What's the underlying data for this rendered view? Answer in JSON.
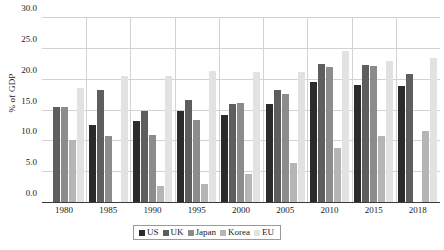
{
  "chart_data": {
    "type": "bar",
    "title": "",
    "xlabel": "",
    "ylabel": "% of GDP",
    "ylim": [
      0,
      30
    ],
    "ytick_step": 5,
    "yticks": [
      "0.0",
      "5.0",
      "10.0",
      "15.0",
      "20.0",
      "25.0",
      "30.0"
    ],
    "grid": true,
    "legend_position": "bottom",
    "categories": [
      "1980",
      "1985",
      "1990",
      "1995",
      "2000",
      "2005",
      "2010",
      "2015",
      "2018"
    ],
    "series": [
      {
        "name": "US",
        "color": "#2b2b2b",
        "values": [
          null,
          12.7,
          13.3,
          14.9,
          14.3,
          16.1,
          19.6,
          19.1,
          18.9
        ]
      },
      {
        "name": "UK",
        "color": "#5e5e5e",
        "values": [
          15.5,
          18.3,
          15.0,
          16.7,
          16.0,
          18.4,
          22.6,
          22.3,
          20.9
        ]
      },
      {
        "name": "Japan",
        "color": "#8c8c8c",
        "values": [
          15.6,
          10.9,
          11.1,
          13.4,
          16.2,
          17.6,
          22.1,
          22.2,
          null
        ]
      },
      {
        "name": "Korea",
        "color": "#b5b5b5",
        "values": [
          10.2,
          null,
          2.8,
          3.1,
          4.7,
          6.5,
          9.0,
          10.8,
          11.6
        ]
      },
      {
        "name": "EU",
        "color": "#e2e2e2",
        "values": [
          18.6,
          20.6,
          20.6,
          21.4,
          21.3,
          21.2,
          24.6,
          23.1,
          23.5
        ]
      }
    ]
  },
  "legend": {
    "items": [
      {
        "label": "US"
      },
      {
        "label": "UK"
      },
      {
        "label": "Japan"
      },
      {
        "label": "Korea"
      },
      {
        "label": "EU"
      }
    ]
  }
}
